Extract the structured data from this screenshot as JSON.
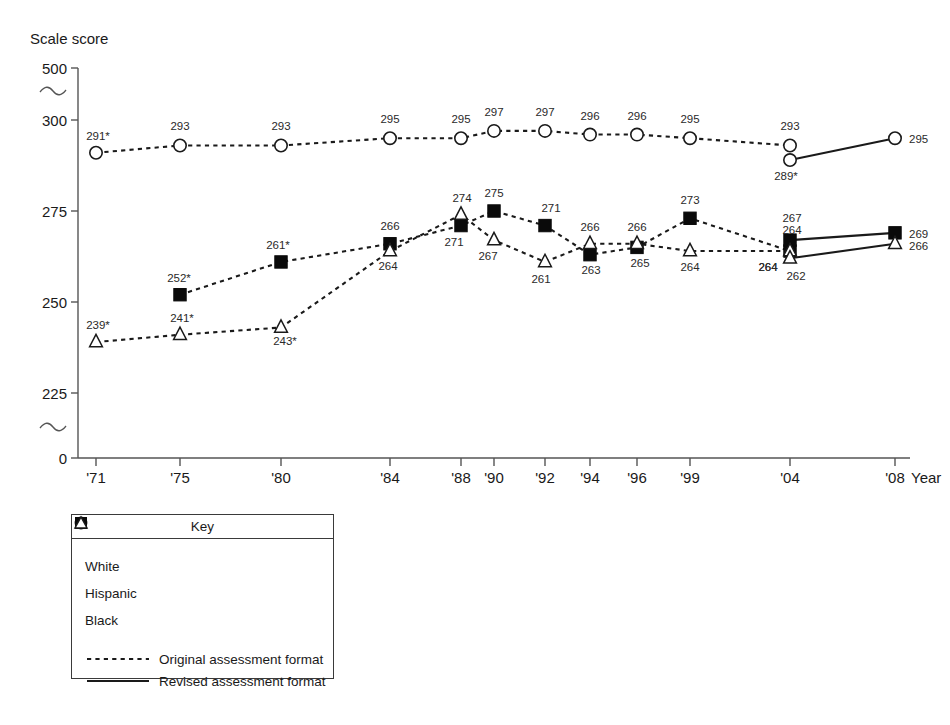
{
  "chart_data": {
    "type": "line",
    "title": "Scale score",
    "xlabel": "Year",
    "ylabel": "Scale score",
    "grid": false,
    "axis_break": true,
    "ylim": [
      0,
      500
    ],
    "y_ticks": [
      "500",
      "300",
      "275",
      "250",
      "225",
      "0"
    ],
    "categories": [
      "'71",
      "'75",
      "'80",
      "'84",
      "'88",
      "'90",
      "'92",
      "'94",
      "'96",
      "'99",
      "'04",
      "'08"
    ],
    "legend_position": "below-left",
    "series": [
      {
        "name": "White",
        "marker": "open-circle",
        "format": "original",
        "x": [
          "'71",
          "'75",
          "'80",
          "'84",
          "'88",
          "'90",
          "'92",
          "'94",
          "'96",
          "'99",
          "'04"
        ],
        "values": [
          291,
          293,
          293,
          295,
          295,
          297,
          297,
          296,
          296,
          295,
          293
        ],
        "labels": [
          "291*",
          "293",
          "293",
          "295",
          "295",
          "297",
          "297",
          "296",
          "296",
          "295",
          "293"
        ]
      },
      {
        "name": "White",
        "marker": "open-circle",
        "format": "revised",
        "x": [
          "'04",
          "'08"
        ],
        "values": [
          289,
          295
        ],
        "labels": [
          "289*",
          "295"
        ]
      },
      {
        "name": "Hispanic",
        "marker": "filled-square",
        "format": "original",
        "x": [
          "'75",
          "'80",
          "'84",
          "'88",
          "'90",
          "'92",
          "'94",
          "'96",
          "'99",
          "'04"
        ],
        "values": [
          252,
          261,
          266,
          271,
          275,
          271,
          263,
          265,
          273,
          264
        ],
        "labels": [
          "252*",
          "261*",
          "266",
          "271",
          "275",
          "271",
          "263",
          "265",
          "273",
          "264"
        ]
      },
      {
        "name": "Hispanic",
        "marker": "filled-square",
        "format": "revised",
        "x": [
          "'04",
          "'08"
        ],
        "values": [
          267,
          269
        ],
        "labels": [
          "267",
          "269"
        ]
      },
      {
        "name": "Black",
        "marker": "open-triangle",
        "format": "original",
        "x": [
          "'71",
          "'75",
          "'80",
          "'84",
          "'88",
          "'90",
          "'92",
          "'94",
          "'96",
          "'99",
          "'04"
        ],
        "values": [
          239,
          241,
          243,
          264,
          274,
          267,
          261,
          266,
          266,
          264,
          264
        ],
        "labels": [
          "239*",
          "241*",
          "243*",
          "264",
          "274",
          "267",
          "261",
          "266",
          "266",
          "264",
          "264"
        ]
      },
      {
        "name": "Black",
        "marker": "open-triangle",
        "format": "revised",
        "x": [
          "'04",
          "'08"
        ],
        "values": [
          262,
          266
        ],
        "labels": [
          "262",
          "266"
        ]
      }
    ]
  },
  "legend": {
    "title": "Key",
    "marker_entries": [
      {
        "label": "White",
        "marker": "open-circle"
      },
      {
        "label": "Hispanic",
        "marker": "filled-square"
      },
      {
        "label": "Black",
        "marker": "open-triangle"
      }
    ],
    "format_entries": [
      {
        "label": "Original assessment format",
        "style": "dashed"
      },
      {
        "label": "Revised assessment format",
        "style": "solid"
      }
    ]
  },
  "colors": {
    "line": "#1a1a1a",
    "marker_fill_open": "#ffffff",
    "marker_fill_solid": "#0a0a0a",
    "axis": "#555555",
    "text": "#1a1a1a"
  },
  "labels": {
    "y_500": "500",
    "y_300": "300",
    "y_275": "275",
    "y_250": "250",
    "y_225": "225",
    "y_0": "0",
    "x_year_suffix": "Year"
  }
}
